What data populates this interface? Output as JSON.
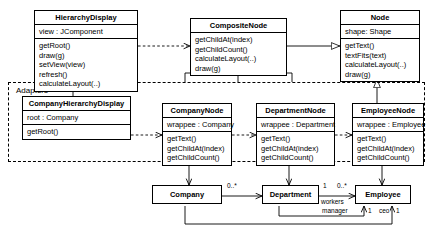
{
  "diagram": {
    "frame": {
      "label": "Adapters"
    }
  },
  "classes": {
    "hierarchy_display": {
      "name": "HierarchyDisplay",
      "attributes": [
        "view : JComponent"
      ],
      "operations": [
        "getRoot()",
        "draw(g)",
        "setView(view)",
        "refresh()",
        "calculateLayout(..)"
      ]
    },
    "composite_node": {
      "name": "CompositeNode",
      "attributes": [],
      "operations": [
        "getChildAt(index)",
        "getChildCount()",
        "calculateLayout(..)",
        "draw(g)"
      ]
    },
    "node": {
      "name": "Node",
      "attributes": [
        "shape: Shape"
      ],
      "operations": [
        "getText()",
        "textFits(text)",
        "calculateLayout(..)",
        "draw(g)"
      ]
    },
    "company_hierarchy_display": {
      "name": "CompanyHierarchyDisplay",
      "attributes": [
        "root : Company"
      ],
      "operations": [
        "getRoot()"
      ]
    },
    "company_node": {
      "name": "CompanyNode",
      "attributes": [
        "wrappee : Company"
      ],
      "operations": [
        "getText()",
        "getChildAt(index)",
        "getChildCount()"
      ]
    },
    "department_node": {
      "name": "DepartmentNode",
      "attributes": [
        "wrappee : Department"
      ],
      "operations": [
        "getText()",
        "getChildAt(index)",
        "getChildCount()"
      ]
    },
    "employee_node": {
      "name": "EmployeeNode",
      "attributes": [
        "wrappee : Employee"
      ],
      "operations": [
        "getText()",
        "getChildAt(index)",
        "getChildCount()"
      ]
    },
    "company": {
      "name": "Company"
    },
    "department": {
      "name": "Department"
    },
    "employee": {
      "name": "Employee"
    }
  },
  "edge_labels": {
    "company_to_department_mult": "0..*",
    "department_end_one": "1",
    "department_to_employee_mult": "0..*",
    "workers_role": "workers",
    "manager_role": "manager",
    "manager_mult": "1",
    "ceo_role": "ceo",
    "ceo_mult": "1"
  },
  "colors": {
    "line": "#000000",
    "background": "#ffffff",
    "text": "#000000"
  }
}
